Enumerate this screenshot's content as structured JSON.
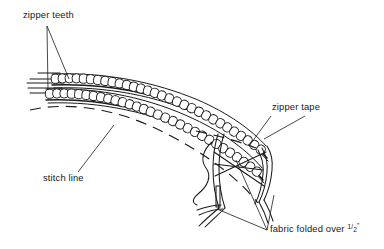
{
  "diagram": {
    "subject": "zipper",
    "background_color": "#ffffff",
    "ink_color": "#1a1a1a",
    "labels": [
      {
        "id": "zipper-teeth",
        "text": "zipper teeth",
        "x": 23,
        "y": 18,
        "anchor": "start",
        "leaders": 2
      },
      {
        "id": "zipper-tape",
        "text": "zipper tape",
        "x": 272,
        "y": 110,
        "anchor": "start",
        "leaders": 2
      },
      {
        "id": "stitch-line",
        "text": "stitch line",
        "x": 43,
        "y": 181,
        "anchor": "start",
        "leaders": 1
      },
      {
        "id": "fabric-folded",
        "text_before": "fabric folded over ",
        "fraction_numerator": "1",
        "fraction_denominator": "2",
        "unit_mark": "\"",
        "text_full": "fabric folded over 1/2\"",
        "x": 270,
        "y": 232,
        "anchor": "start",
        "leaders": 2
      }
    ],
    "parts": {
      "upper_tooth_row_count": 30,
      "lower_tooth_row_count": 30,
      "stitch_line_style": "dashed",
      "tape_edge_lines": 4
    }
  }
}
